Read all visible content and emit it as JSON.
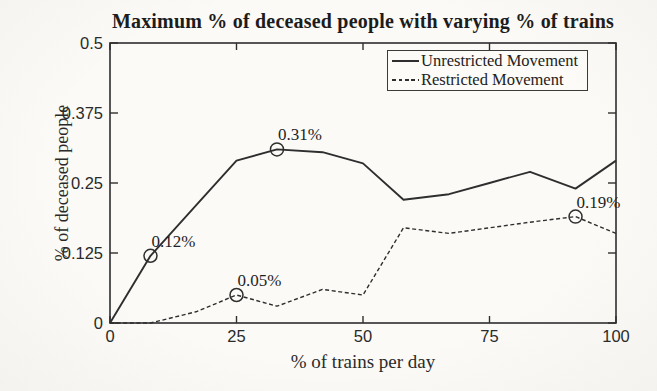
{
  "figure": {
    "background": "#fbfaf7",
    "ink_color": "#2e2e2e",
    "text_color": "#1f1f1f"
  },
  "chart_data": {
    "type": "line",
    "title": "Maximum % of deceased people with varying % of trains",
    "xlabel": "% of trains per day",
    "ylabel": "% of deceased people",
    "xlim": [
      0,
      100
    ],
    "ylim": [
      0,
      0.5
    ],
    "x_ticks": [
      0,
      25,
      50,
      75,
      100
    ],
    "x_tick_labels": [
      "0",
      "25",
      "50",
      "75",
      "100"
    ],
    "y_ticks": [
      0,
      0.125,
      0.25,
      0.375,
      0.5
    ],
    "y_tick_labels": [
      "0",
      "0.125",
      "0.25",
      "0.375",
      "0.5"
    ],
    "grid": false,
    "legend_position": "top-right",
    "x": [
      0,
      8,
      17,
      25,
      33,
      42,
      50,
      58,
      67,
      75,
      83,
      92,
      100
    ],
    "series": [
      {
        "name": "Unrestricted Movement",
        "style": "solid",
        "values": [
          0,
          0.12,
          0.21,
          0.29,
          0.31,
          0.305,
          0.285,
          0.22,
          0.23,
          0.25,
          0.27,
          0.24,
          0.29
        ]
      },
      {
        "name": "Restricted Movement",
        "style": "dashed",
        "values": [
          0,
          0,
          0.02,
          0.05,
          0.03,
          0.06,
          0.05,
          0.17,
          0.16,
          0.17,
          0.18,
          0.19,
          0.16
        ]
      }
    ],
    "annotations": [
      {
        "series": "Unrestricted Movement",
        "x": 8,
        "y": 0.12,
        "label": "0.12%"
      },
      {
        "series": "Unrestricted Movement",
        "x": 33,
        "y": 0.31,
        "label": "0.31%"
      },
      {
        "series": "Restricted Movement",
        "x": 25,
        "y": 0.05,
        "label": "0.05%"
      },
      {
        "series": "Restricted Movement",
        "x": 92,
        "y": 0.19,
        "label": "0.19%"
      }
    ]
  }
}
